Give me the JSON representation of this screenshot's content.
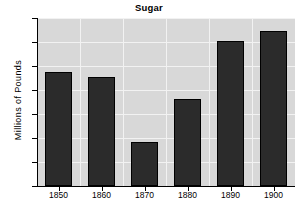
{
  "chart_data": {
    "type": "bar",
    "title": "Sugar",
    "xlabel": "",
    "ylabel": "Millions of Pounds",
    "categories": [
      "1850",
      "1860",
      "1870",
      "1880",
      "1890",
      "1900"
    ],
    "values": [
      237,
      227,
      92,
      181,
      303,
      322
    ],
    "ylim": [
      0,
      350
    ],
    "yticks": [
      0,
      50,
      100,
      150,
      200,
      250,
      300,
      350
    ],
    "ytick_labels": [
      "0",
      "50",
      "100",
      "150",
      "200",
      "250",
      "300",
      "350"
    ],
    "grid": true,
    "legend": null,
    "colors": {
      "bar_fill": "#2b2b2b",
      "bar_edge": "#000000",
      "plot_background": "#d8d8d8",
      "gridline": "#f2f2f2",
      "axis": "#000000",
      "figure_background": "#ffffff",
      "text": "#000000"
    }
  }
}
